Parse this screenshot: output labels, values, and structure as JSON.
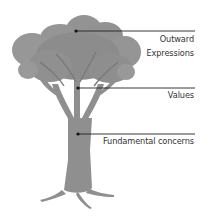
{
  "diagram": {
    "type": "tree-metaphor",
    "colors": {
      "tree": "#8f8f8f",
      "tree_dark": "#7a7a7a",
      "line": "#222222",
      "text": "#333333"
    },
    "labels": [
      {
        "id": "outward",
        "line1": "Outward",
        "line2": "Expressions",
        "level": "canopy"
      },
      {
        "id": "values",
        "line1": "Values",
        "level": "branches"
      },
      {
        "id": "fundamental",
        "line1": "Fundamental concerns",
        "level": "trunk"
      }
    ]
  }
}
